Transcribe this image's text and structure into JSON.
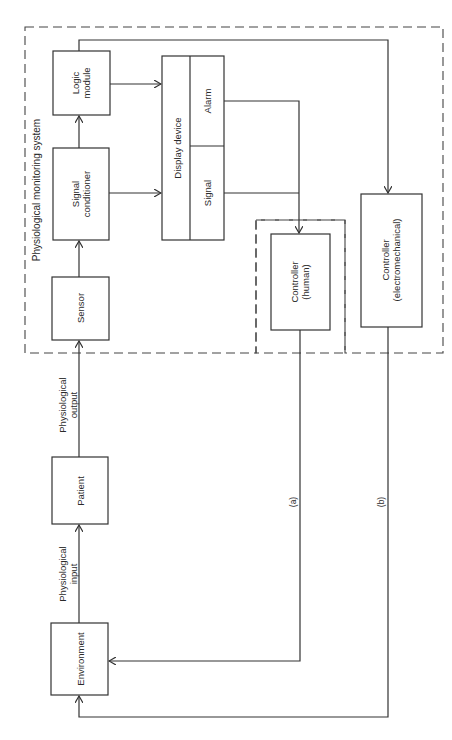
{
  "diagram": {
    "system_label": "Physiological monitoring system",
    "blocks": {
      "logic_module": {
        "line1": "Logic",
        "line2": "module"
      },
      "signal_conditioner": {
        "line1": "Signal",
        "line2": "conditioner"
      },
      "sensor": {
        "label": "Sensor"
      },
      "display_device": {
        "label": "Display device",
        "alarm": "Alarm",
        "signal": "Signal"
      },
      "controller_human": {
        "line1": "Controller",
        "line2": "(human)"
      },
      "controller_electromechanical": {
        "line1": "Controller",
        "line2": "(electromechanical)"
      },
      "patient": {
        "label": "Patient"
      },
      "environment": {
        "label": "Environment"
      }
    },
    "edge_labels": {
      "physiological_output": {
        "line1": "Physiological",
        "line2": "output"
      },
      "physiological_input": {
        "line1": "Physiological",
        "line2": "input"
      },
      "path_a": "(a)",
      "path_b": "(b)"
    },
    "colors": {
      "stroke": "#333333",
      "background": "#ffffff"
    }
  }
}
